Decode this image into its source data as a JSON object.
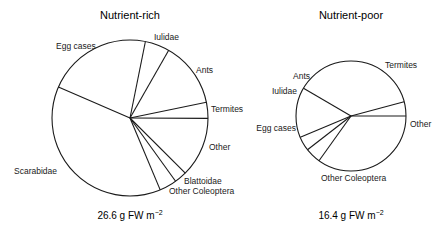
{
  "colors": {
    "stroke": "#1a1a1a",
    "fill": "#ffffff",
    "text": "#1a1a1a"
  },
  "chart_data": [
    {
      "type": "pie",
      "title": "Nutrient-rich",
      "total_label": "26.6 g FW m",
      "total_superscript": "−2",
      "total_value": 26.6,
      "units": "g FW m^-2",
      "center": [
        130,
        118
      ],
      "radius": 78,
      "start_angle_deg": 156.7,
      "slices": [
        {
          "label": "Egg cases",
          "percent": 21.7,
          "label_pos": [
            56,
            49
          ],
          "anchor": "start"
        },
        {
          "label": "Iulidae",
          "percent": 5.1,
          "label_pos": [
            154,
            40
          ],
          "anchor": "start"
        },
        {
          "label": "Ants",
          "percent": 13.5,
          "label_pos": [
            196,
            73
          ],
          "anchor": "start"
        },
        {
          "label": "Termites",
          "percent": 3.3,
          "label_pos": [
            211,
            112
          ],
          "anchor": "start"
        },
        {
          "label": "Other",
          "percent": 12.4,
          "label_pos": [
            209,
            150
          ],
          "anchor": "start"
        },
        {
          "label": "Blattoidae",
          "percent": 2.6,
          "label_pos": [
            184,
            184
          ],
          "anchor": "start"
        },
        {
          "label": "Other Coleoptera",
          "percent": 3.6,
          "label_pos": [
            169,
            194
          ],
          "anchor": "start"
        },
        {
          "label": "Scarabidae",
          "percent": 37.8,
          "label_pos": [
            14,
            174
          ],
          "anchor": "start"
        }
      ]
    },
    {
      "type": "pie",
      "title": "Nutrient-poor",
      "total_label": "16.4 g FW m",
      "total_superscript": "−2",
      "total_value": 16.4,
      "units": "g FW m^-2",
      "center": [
        351,
        116
      ],
      "radius": 55,
      "start_angle_deg": 0,
      "slices": [
        {
          "label": "Termites",
          "percent": 34.9,
          "label_pos": [
            385,
            68
          ],
          "anchor": "start"
        },
        {
          "label": "Ants",
          "percent": 4.6,
          "label_pos": [
            293,
            79
          ],
          "anchor": "start"
        },
        {
          "label": "Iulidae",
          "percent": 4.2,
          "label_pos": [
            272,
            94
          ],
          "anchor": "start"
        },
        {
          "label": "Egg cases",
          "percent": 14.7,
          "label_pos": [
            296,
            131
          ],
          "anchor": "end"
        },
        {
          "label": "Other Coleoptera",
          "percent": 37.4,
          "label_pos": [
            321,
            181
          ],
          "anchor": "start"
        },
        {
          "label": "Other",
          "percent": 4.2,
          "label_pos": [
            410,
            127
          ],
          "anchor": "start"
        }
      ]
    }
  ]
}
